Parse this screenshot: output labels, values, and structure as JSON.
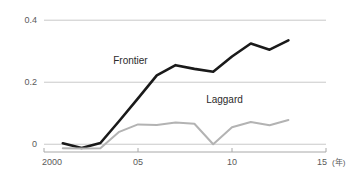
{
  "chart_data": {
    "type": "line",
    "title": "",
    "xlabel": "",
    "ylabel": "",
    "x_unit_label": "(年)",
    "xlim": [
      2000,
      2015
    ],
    "ylim": [
      -0.025,
      0.42
    ],
    "grid": true,
    "gridlines_y": [
      0,
      0.2,
      0.4
    ],
    "legend_position": "inline-annotation",
    "y_ticks": [
      {
        "value": 0,
        "label": "0"
      },
      {
        "value": 0.2,
        "label": "0.2"
      },
      {
        "value": 0.4,
        "label": "0.4"
      }
    ],
    "x_ticks": [
      {
        "value": 2000,
        "label": "2000"
      },
      {
        "value": 2005,
        "label": "05"
      },
      {
        "value": 2010,
        "label": "10"
      },
      {
        "value": 2015,
        "label": "15"
      }
    ],
    "x": [
      2001,
      2002,
      2003,
      2004,
      2005,
      2006,
      2007,
      2008,
      2009,
      2010,
      2011,
      2012,
      2013
    ],
    "series": [
      {
        "name": "Frontier",
        "color": "#1a1a1a",
        "label_x": 2004.6,
        "label_y": 0.258,
        "values": [
          0.003,
          -0.012,
          0.004,
          0.075,
          0.148,
          0.222,
          0.255,
          0.243,
          0.234,
          0.283,
          0.325,
          0.305,
          0.335
        ]
      },
      {
        "name": "Laggard",
        "color": "#b3b3b3",
        "label_x": 2009.6,
        "label_y": 0.132,
        "values": [
          -0.013,
          -0.014,
          -0.013,
          0.04,
          0.064,
          0.062,
          0.07,
          0.066,
          0.0,
          0.055,
          0.072,
          0.061,
          0.078
        ]
      }
    ]
  }
}
